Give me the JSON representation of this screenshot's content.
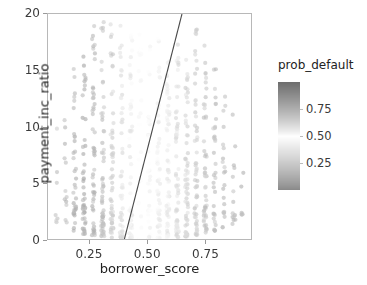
{
  "figure": {
    "background_color": "#ffffff",
    "spine_color": "#b8b8b8"
  },
  "axes": {
    "xlabel": "borrower_score",
    "ylabel": "payment_inc_ratio",
    "x_ticks": [
      "0.25",
      "0.50",
      "0.75"
    ],
    "x_tick_values": [
      0.25,
      0.5,
      0.75
    ],
    "y_ticks": [
      "0",
      "5",
      "10",
      "15",
      "20"
    ],
    "y_tick_values": [
      0,
      5,
      10,
      15,
      20
    ],
    "xlim": [
      0.07,
      0.95
    ],
    "ylim": [
      0,
      20
    ]
  },
  "legend": {
    "title": "prob_default",
    "ticks": [
      "0.75",
      "0.50",
      "0.25"
    ],
    "tick_values": [
      0.75,
      0.5,
      0.25
    ],
    "range": [
      0.0,
      1.0
    ],
    "colormap": "diverging-gray",
    "color_low": "#8a8a8a",
    "color_mid": "#ffffff",
    "color_high": "#6e6e6e"
  },
  "chart_data": {
    "type": "scatter",
    "title": "",
    "xlabel": "borrower_score",
    "ylabel": "payment_inc_ratio",
    "xlim": [
      0.07,
      0.95
    ],
    "ylim": [
      0,
      20
    ],
    "grid": false,
    "legend_position": "right",
    "color_by": "prob_default",
    "colorbar": {
      "label": "prob_default",
      "ticks": [
        0.25,
        0.5,
        0.75
      ],
      "vmin": 0.0,
      "vmax": 1.0
    },
    "annotations": [
      {
        "type": "line",
        "name": "decision-boundary",
        "x": [
          0.396,
          0.645
        ],
        "y": [
          0,
          20
        ],
        "color": "#4a4a4a",
        "width": 1.1
      }
    ],
    "columns": [
      {
        "borrower_score": 0.105,
        "prob_default": 0.66,
        "n": 7,
        "y_min": 1.6,
        "y_max": 11.2
      },
      {
        "borrower_score": 0.145,
        "prob_default": 0.7,
        "n": 12,
        "y_min": 1.3,
        "y_max": 11.0
      },
      {
        "borrower_score": 0.185,
        "prob_default": 0.72,
        "n": 34,
        "y_min": 0.9,
        "y_max": 17.1
      },
      {
        "borrower_score": 0.225,
        "prob_default": 0.74,
        "n": 46,
        "y_min": 0.6,
        "y_max": 16.4
      },
      {
        "borrower_score": 0.265,
        "prob_default": 0.71,
        "n": 52,
        "y_min": 0.5,
        "y_max": 19.3
      },
      {
        "borrower_score": 0.305,
        "prob_default": 0.68,
        "n": 58,
        "y_min": 0.4,
        "y_max": 19.5
      },
      {
        "borrower_score": 0.345,
        "prob_default": 0.63,
        "n": 55,
        "y_min": 0.3,
        "y_max": 19.6
      },
      {
        "borrower_score": 0.385,
        "prob_default": 0.58,
        "n": 50,
        "y_min": 0.3,
        "y_max": 19.7
      },
      {
        "borrower_score": 0.425,
        "prob_default": 0.54,
        "n": 48,
        "y_min": 0.2,
        "y_max": 18.6
      },
      {
        "borrower_score": 0.465,
        "prob_default": 0.5,
        "n": 50,
        "y_min": 0.2,
        "y_max": 19.0
      },
      {
        "borrower_score": 0.505,
        "prob_default": 0.47,
        "n": 52,
        "y_min": 0.2,
        "y_max": 19.5
      },
      {
        "borrower_score": 0.545,
        "prob_default": 0.43,
        "n": 54,
        "y_min": 0.2,
        "y_max": 18.0
      },
      {
        "borrower_score": 0.585,
        "prob_default": 0.39,
        "n": 56,
        "y_min": 0.3,
        "y_max": 16.8
      },
      {
        "borrower_score": 0.625,
        "prob_default": 0.35,
        "n": 58,
        "y_min": 0.3,
        "y_max": 17.6
      },
      {
        "borrower_score": 0.665,
        "prob_default": 0.31,
        "n": 60,
        "y_min": 0.4,
        "y_max": 16.3
      },
      {
        "borrower_score": 0.705,
        "prob_default": 0.27,
        "n": 56,
        "y_min": 0.5,
        "y_max": 19.0
      },
      {
        "borrower_score": 0.745,
        "prob_default": 0.24,
        "n": 48,
        "y_min": 0.6,
        "y_max": 17.7
      },
      {
        "borrower_score": 0.785,
        "prob_default": 0.22,
        "n": 34,
        "y_min": 0.9,
        "y_max": 15.9
      },
      {
        "borrower_score": 0.825,
        "prob_default": 0.2,
        "n": 22,
        "y_min": 1.2,
        "y_max": 13.6
      },
      {
        "borrower_score": 0.868,
        "prob_default": 0.18,
        "n": 14,
        "y_min": 1.5,
        "y_max": 11.5
      },
      {
        "borrower_score": 0.905,
        "prob_default": 0.17,
        "n": 6,
        "y_min": 2.3,
        "y_max": 10.4
      }
    ]
  }
}
